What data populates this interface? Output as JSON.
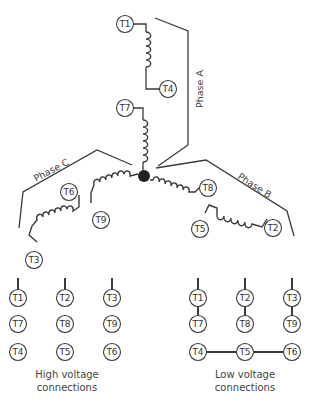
{
  "diagram": {
    "type": "nine-lead wye motor connection diagram",
    "junction": "star-point",
    "phases": [
      {
        "label": "Phase A",
        "coils": [
          [
            "T1",
            "T4"
          ],
          [
            "T7",
            "star"
          ]
        ]
      },
      {
        "label": "Phase B",
        "coils": [
          [
            "T8",
            "star"
          ],
          [
            "T5",
            "T2"
          ]
        ]
      },
      {
        "label": "Phase C",
        "coils": [
          [
            "T9",
            "star"
          ],
          [
            "T6",
            "T3"
          ]
        ]
      }
    ],
    "terminals": {
      "T1": "T1",
      "T2": "T2",
      "T3": "T3",
      "T4": "T4",
      "T5": "T5",
      "T6": "T6",
      "T7": "T7",
      "T8": "T8",
      "T9": "T9"
    },
    "high_voltage": {
      "caption_line1": "High voltage",
      "caption_line2": "connections",
      "columns": [
        [
          "T1",
          "T7",
          "T4"
        ],
        [
          "T2",
          "T8",
          "T5"
        ],
        [
          "T3",
          "T9",
          "T6"
        ]
      ]
    },
    "low_voltage": {
      "caption_line1": "Low voltage",
      "caption_line2": "connections",
      "columns": [
        [
          "T1",
          "T7"
        ],
        [
          "T2",
          "T8"
        ],
        [
          "T3",
          "T9"
        ]
      ],
      "bottom_row": [
        "T4",
        "T5",
        "T6"
      ]
    }
  }
}
